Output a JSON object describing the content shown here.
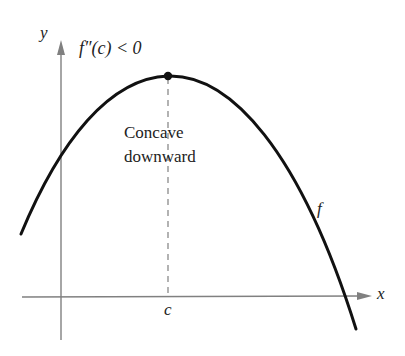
{
  "diagram": {
    "axes": {
      "x_label": "x",
      "y_label": "y",
      "axis_color": "#808080"
    },
    "curve": {
      "name": "f",
      "color": "#111111",
      "shape": "downward parabola"
    },
    "point": {
      "label": "c",
      "description": "maximum point on curve at x = c"
    },
    "condition": "f″(c) < 0",
    "annotation_line1": "Concave",
    "annotation_line2": "downward"
  }
}
